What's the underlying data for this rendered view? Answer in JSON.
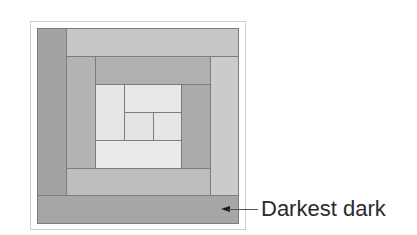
{
  "diagram": {
    "type": "log-cabin-quilt-block",
    "annotation": {
      "label": "Darkest dark",
      "points_to": "bottom-strip"
    },
    "colors": {
      "outer_left": "#a3a3a3",
      "outer_top": "#c6c6c6",
      "outer_right": "#cbcbcb",
      "outer_bottom": "#a6a6a6",
      "ring2_left": "#b4b4b4",
      "ring2_top": "#b0b0b0",
      "ring2_right": "#ababab",
      "ring2_bottom": "#bdbdbd",
      "center_light": "#e6e6e6",
      "center_lighter": "#eaeaea",
      "line": "#7d7d7d",
      "frame": "#cfcfcf"
    }
  }
}
